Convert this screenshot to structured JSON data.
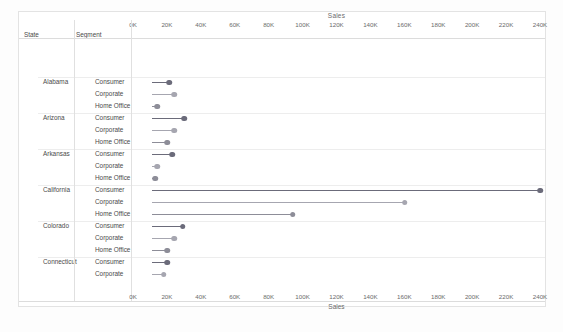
{
  "sheet": {
    "background": "#ffffff",
    "border_color": "#e3e3e3"
  },
  "columns": {
    "state_header": "State",
    "segment_header": "Segment"
  },
  "axis": {
    "title": "Sales",
    "min": 0,
    "max": 248000,
    "tick_step": 20000,
    "tick_labels": [
      "0K",
      "20K",
      "40K",
      "60K",
      "80K",
      "100K",
      "120K",
      "140K",
      "160K",
      "180K",
      "200K",
      "220K",
      "240K"
    ],
    "tick_values": [
      0,
      20000,
      40000,
      60000,
      80000,
      100000,
      120000,
      140000,
      160000,
      180000,
      200000,
      220000,
      240000
    ],
    "position": [
      "top",
      "bottom"
    ]
  },
  "colors": {
    "consumer": "#6b6b7a",
    "corporate": "#a6a6b0",
    "home_office": "#8d8d98",
    "grid": "#ededed",
    "rule": "#dcdcdc",
    "text": "#4a4a4a",
    "axis_text": "#6b6b6b"
  },
  "chart_data": {
    "type": "bar",
    "title": "Sales",
    "xlabel": "Sales",
    "ylabel": "State / Segment",
    "xlim": [
      0,
      248000
    ],
    "grid": false,
    "legend": "none",
    "categories": [
      "Alabama - Consumer",
      "Alabama - Corporate",
      "Alabama - Home Office",
      "Arizona - Consumer",
      "Arizona - Corporate",
      "Arizona - Home Office",
      "Arkansas - Consumer",
      "Arkansas - Corporate",
      "Arkansas - Home Office",
      "California - Consumer",
      "California - Corporate",
      "California - Home Office",
      "Colorado - Consumer",
      "Colorado - Corporate",
      "Colorado - Home Office",
      "Connecticut - Consumer",
      "Connecticut - Corporate",
      "Connecticut - Home Office",
      "Delaware - Consumer",
      "Delaware - Corporate",
      "Delaware - Home Office",
      "District of Columbia - Consumer"
    ],
    "values": [
      10000,
      13000,
      3000,
      19000,
      13000,
      9000,
      12000,
      3000,
      2000,
      229000,
      149000,
      83000,
      18000,
      13000,
      9000,
      9000,
      7000,
      2500,
      20000,
      11000,
      2500,
      2500
    ]
  },
  "rows": [
    {
      "state": "Alabama",
      "group_start": true,
      "segment": "Consumer",
      "value": 10000,
      "color_key": "consumer"
    },
    {
      "state": "",
      "group_start": false,
      "segment": "Corporate",
      "value": 13000,
      "color_key": "corporate"
    },
    {
      "state": "",
      "group_start": false,
      "segment": "Home Office",
      "value": 3000,
      "color_key": "home_office"
    },
    {
      "state": "Arizona",
      "group_start": true,
      "segment": "Consumer",
      "value": 19000,
      "color_key": "consumer"
    },
    {
      "state": "",
      "group_start": false,
      "segment": "Corporate",
      "value": 13000,
      "color_key": "corporate"
    },
    {
      "state": "",
      "group_start": false,
      "segment": "Home Office",
      "value": 9000,
      "color_key": "home_office"
    },
    {
      "state": "Arkansas",
      "group_start": true,
      "segment": "Consumer",
      "value": 12000,
      "color_key": "consumer"
    },
    {
      "state": "",
      "group_start": false,
      "segment": "Corporate",
      "value": 3000,
      "color_key": "corporate"
    },
    {
      "state": "",
      "group_start": false,
      "segment": "Home Office",
      "value": 2000,
      "color_key": "home_office"
    },
    {
      "state": "California",
      "group_start": true,
      "segment": "Consumer",
      "value": 229000,
      "color_key": "consumer"
    },
    {
      "state": "",
      "group_start": false,
      "segment": "Corporate",
      "value": 149000,
      "color_key": "corporate"
    },
    {
      "state": "",
      "group_start": false,
      "segment": "Home Office",
      "value": 83000,
      "color_key": "home_office"
    },
    {
      "state": "Colorado",
      "group_start": true,
      "segment": "Consumer",
      "value": 18000,
      "color_key": "consumer"
    },
    {
      "state": "",
      "group_start": false,
      "segment": "Corporate",
      "value": 13000,
      "color_key": "corporate"
    },
    {
      "state": "",
      "group_start": false,
      "segment": "Home Office",
      "value": 9000,
      "color_key": "home_office"
    },
    {
      "state": "Connecticut",
      "group_start": true,
      "segment": "Consumer",
      "value": 9000,
      "color_key": "consumer"
    },
    {
      "state": "",
      "group_start": false,
      "segment": "Corporate",
      "value": 7000,
      "color_key": "corporate"
    },
    {
      "state": "",
      "group_start": false,
      "segment": "Home Office",
      "value": 2500,
      "color_key": "home_office"
    },
    {
      "state": "Delaware",
      "group_start": true,
      "segment": "Consumer",
      "value": 20000,
      "color_key": "consumer"
    },
    {
      "state": "",
      "group_start": false,
      "segment": "Corporate",
      "value": 11000,
      "color_key": "corporate"
    },
    {
      "state": "",
      "group_start": false,
      "segment": "Home Office",
      "value": 2500,
      "color_key": "home_office"
    },
    {
      "state": "District of Columbia",
      "group_start": true,
      "segment": "Consumer",
      "value": 2500,
      "color_key": "consumer"
    }
  ]
}
